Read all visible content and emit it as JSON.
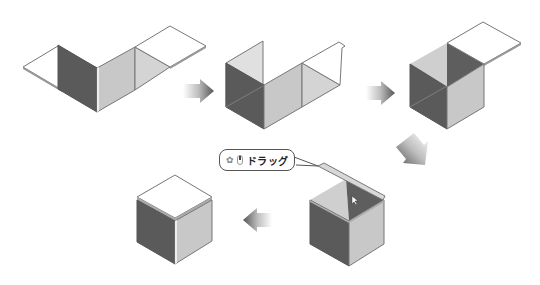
{
  "diagram": {
    "steps": [
      {
        "id": 1,
        "label": "flat net with two walls raised"
      },
      {
        "id": 2,
        "label": "three walls raised"
      },
      {
        "id": 3,
        "label": "open box with lid flap"
      },
      {
        "id": 4,
        "label": "lid dragged closed"
      },
      {
        "id": 5,
        "label": "closed cube"
      }
    ],
    "callout": {
      "icons": [
        "gear-hand-icon",
        "mouse-icon"
      ],
      "text": "ドラッグ"
    },
    "arrows": [
      {
        "from": 1,
        "to": 2,
        "direction": "right"
      },
      {
        "from": 2,
        "to": 3,
        "direction": "right"
      },
      {
        "from": 3,
        "to": 4,
        "direction": "down-left"
      },
      {
        "from": 4,
        "to": 5,
        "direction": "left"
      }
    ],
    "colors": {
      "dark_face": "#5a5a5a",
      "light_face": "#c8c8c8",
      "floor_face": "#d4d4d4",
      "white_face": "#ffffff",
      "edge": "#7a7a7a"
    }
  }
}
